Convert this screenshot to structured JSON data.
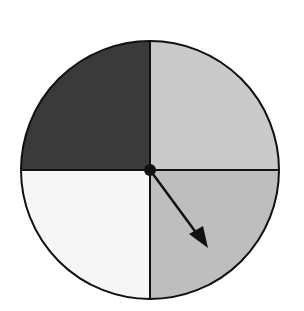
{
  "spinner": {
    "center": [
      150,
      170
    ],
    "radius": 129,
    "sections": [
      {
        "name": "top-left",
        "color": "#3a3a3a"
      },
      {
        "name": "top-right",
        "color": "#cacaca"
      },
      {
        "name": "bottom-right",
        "color": "#bebebe"
      },
      {
        "name": "bottom-left",
        "color": "#f6f6f6"
      }
    ],
    "arrow": {
      "tip": [
        208,
        248
      ],
      "color": "#111111"
    }
  }
}
